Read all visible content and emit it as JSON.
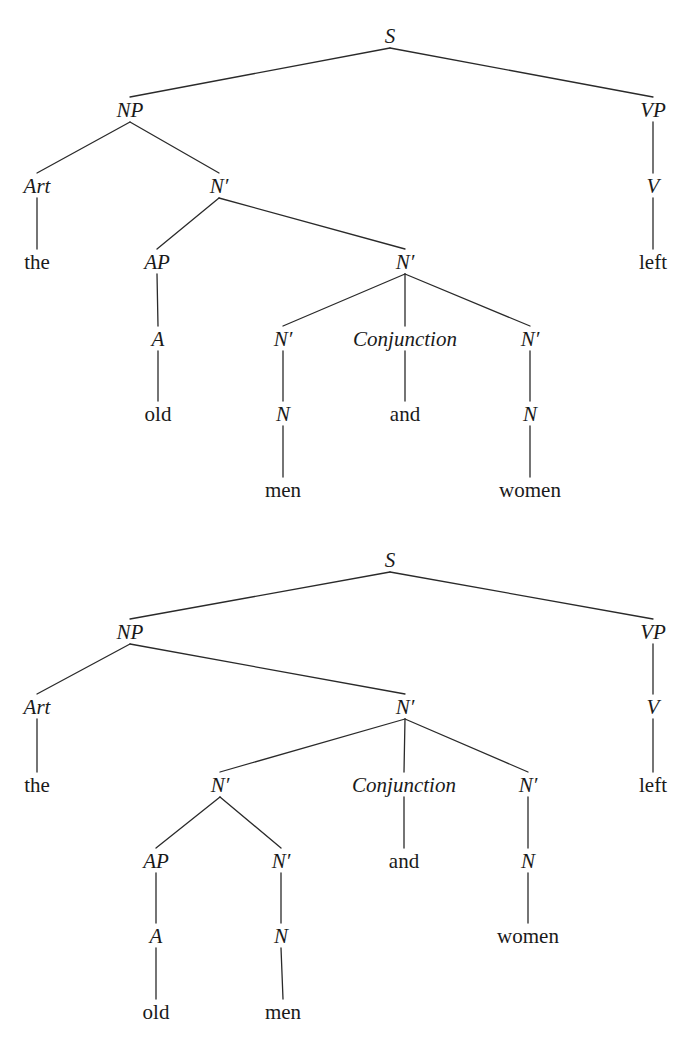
{
  "trees": [
    {
      "id": "tree-1",
      "top": 0,
      "height": 510,
      "nodes": [
        {
          "id": "S",
          "label": "S",
          "type": "cat",
          "x": 390,
          "y": 36
        },
        {
          "id": "NP",
          "label": "NP",
          "type": "cat",
          "x": 130,
          "y": 110
        },
        {
          "id": "VP",
          "label": "VP",
          "type": "cat",
          "x": 653,
          "y": 110
        },
        {
          "id": "Art",
          "label": "Art",
          "type": "cat",
          "x": 37,
          "y": 186
        },
        {
          "id": "Nb1",
          "label": "N′",
          "type": "cat",
          "x": 219,
          "y": 186
        },
        {
          "id": "V",
          "label": "V",
          "type": "cat",
          "x": 653,
          "y": 186
        },
        {
          "id": "the",
          "label": "the",
          "type": "word",
          "x": 37,
          "y": 262
        },
        {
          "id": "AP",
          "label": "AP",
          "type": "cat",
          "x": 157,
          "y": 262
        },
        {
          "id": "Nb2",
          "label": "N′",
          "type": "cat",
          "x": 405,
          "y": 262
        },
        {
          "id": "left",
          "label": "left",
          "type": "word",
          "x": 653,
          "y": 262
        },
        {
          "id": "A",
          "label": "A",
          "type": "cat",
          "x": 158,
          "y": 339
        },
        {
          "id": "Nb3",
          "label": "N′",
          "type": "cat",
          "x": 283,
          "y": 339
        },
        {
          "id": "Conj",
          "label": "Conjunction",
          "type": "cat",
          "x": 405,
          "y": 339
        },
        {
          "id": "Nb4",
          "label": "N′",
          "type": "cat",
          "x": 530,
          "y": 339
        },
        {
          "id": "old",
          "label": "old",
          "type": "word",
          "x": 158,
          "y": 414
        },
        {
          "id": "N1",
          "label": "N",
          "type": "cat",
          "x": 283,
          "y": 414
        },
        {
          "id": "and",
          "label": "and",
          "type": "word",
          "x": 405,
          "y": 414
        },
        {
          "id": "N2",
          "label": "N",
          "type": "cat",
          "x": 530,
          "y": 414
        },
        {
          "id": "men",
          "label": "men",
          "type": "word",
          "x": 283,
          "y": 490
        },
        {
          "id": "women",
          "label": "women",
          "type": "word",
          "x": 530,
          "y": 490
        }
      ],
      "edges": [
        [
          "S",
          "NP"
        ],
        [
          "S",
          "VP"
        ],
        [
          "NP",
          "Art"
        ],
        [
          "NP",
          "Nb1"
        ],
        [
          "VP",
          "V"
        ],
        [
          "Art",
          "the"
        ],
        [
          "Nb1",
          "AP"
        ],
        [
          "Nb1",
          "Nb2"
        ],
        [
          "V",
          "left"
        ],
        [
          "AP",
          "A"
        ],
        [
          "Nb2",
          "Nb3"
        ],
        [
          "Nb2",
          "Conj"
        ],
        [
          "Nb2",
          "Nb4"
        ],
        [
          "A",
          "old"
        ],
        [
          "Nb3",
          "N1"
        ],
        [
          "Conj",
          "and"
        ],
        [
          "Nb4",
          "N2"
        ],
        [
          "N1",
          "men"
        ],
        [
          "N2",
          "women"
        ]
      ]
    },
    {
      "id": "tree-2",
      "top": 0,
      "height": 1042,
      "nodes": [
        {
          "id": "S",
          "label": "S",
          "type": "cat",
          "x": 390,
          "y": 560
        },
        {
          "id": "NP",
          "label": "NP",
          "type": "cat",
          "x": 130,
          "y": 632
        },
        {
          "id": "VP",
          "label": "VP",
          "type": "cat",
          "x": 653,
          "y": 632
        },
        {
          "id": "Art",
          "label": "Art",
          "type": "cat",
          "x": 37,
          "y": 707
        },
        {
          "id": "Nb1",
          "label": "N′",
          "type": "cat",
          "x": 405,
          "y": 707
        },
        {
          "id": "V",
          "label": "V",
          "type": "cat",
          "x": 653,
          "y": 707
        },
        {
          "id": "the",
          "label": "the",
          "type": "word",
          "x": 37,
          "y": 785
        },
        {
          "id": "Nb2",
          "label": "N′",
          "type": "cat",
          "x": 220,
          "y": 785
        },
        {
          "id": "Conj",
          "label": "Conjunction",
          "type": "cat",
          "x": 404,
          "y": 785
        },
        {
          "id": "Nb3",
          "label": "N′",
          "type": "cat",
          "x": 528,
          "y": 785
        },
        {
          "id": "left",
          "label": "left",
          "type": "word",
          "x": 653,
          "y": 785
        },
        {
          "id": "AP",
          "label": "AP",
          "type": "cat",
          "x": 156,
          "y": 861
        },
        {
          "id": "Nb4",
          "label": "N′",
          "type": "cat",
          "x": 281,
          "y": 861
        },
        {
          "id": "and",
          "label": "and",
          "type": "word",
          "x": 404,
          "y": 861
        },
        {
          "id": "N1",
          "label": "N",
          "type": "cat",
          "x": 528,
          "y": 861
        },
        {
          "id": "A",
          "label": "A",
          "type": "cat",
          "x": 156,
          "y": 936
        },
        {
          "id": "N2",
          "label": "N",
          "type": "cat",
          "x": 281,
          "y": 936
        },
        {
          "id": "women",
          "label": "women",
          "type": "word",
          "x": 528,
          "y": 936
        },
        {
          "id": "old",
          "label": "old",
          "type": "word",
          "x": 156,
          "y": 1012
        },
        {
          "id": "men",
          "label": "men",
          "type": "word",
          "x": 283,
          "y": 1012
        }
      ],
      "edges": [
        [
          "S",
          "NP"
        ],
        [
          "S",
          "VP"
        ],
        [
          "NP",
          "Art"
        ],
        [
          "NP",
          "Nb1"
        ],
        [
          "VP",
          "V"
        ],
        [
          "Art",
          "the"
        ],
        [
          "Nb1",
          "Nb2"
        ],
        [
          "Nb1",
          "Conj"
        ],
        [
          "Nb1",
          "Nb3"
        ],
        [
          "V",
          "left"
        ],
        [
          "Nb2",
          "AP"
        ],
        [
          "Nb2",
          "Nb4"
        ],
        [
          "Nb3",
          "N1"
        ],
        [
          "Conj",
          "and"
        ],
        [
          "AP",
          "A"
        ],
        [
          "Nb4",
          "N2"
        ],
        [
          "N1",
          "women"
        ],
        [
          "A",
          "old"
        ],
        [
          "N2",
          "men"
        ]
      ]
    }
  ],
  "style": {
    "line_color": "#2a2a2a",
    "text_color": "#1a1a1a",
    "background": "#ffffff"
  }
}
